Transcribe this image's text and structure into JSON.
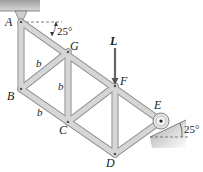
{
  "diagram": {
    "type": "truss",
    "joints": {
      "A": {
        "label": "A",
        "x": 21,
        "y": 22
      },
      "G": {
        "label": "G",
        "x": 68,
        "y": 52
      },
      "B": {
        "label": "B",
        "x": 21,
        "y": 89
      },
      "C": {
        "label": "C",
        "x": 68,
        "y": 122
      },
      "F": {
        "label": "F",
        "x": 115,
        "y": 86
      },
      "D": {
        "label": "D",
        "x": 115,
        "y": 154
      },
      "E": {
        "label": "E",
        "x": 161,
        "y": 121
      }
    },
    "members": [
      "AB",
      "AG",
      "GF",
      "FE",
      "BG",
      "BC",
      "GC",
      "CF",
      "CD",
      "FD",
      "DE"
    ],
    "dimension_labels": [
      {
        "text": "b",
        "member": "BG"
      },
      {
        "text": "b",
        "member": "GC"
      },
      {
        "text": "b",
        "member": "BC"
      }
    ],
    "load": {
      "label": "L",
      "joint": "F",
      "direction": "down"
    },
    "angles": [
      {
        "text": "25°",
        "location": "at A between horizontal and member AG"
      },
      {
        "text": "25°",
        "location": "incline of roller support at E"
      }
    ],
    "supports": [
      {
        "joint": "A",
        "type": "pin",
        "ground": "ceiling"
      },
      {
        "joint": "E",
        "type": "roller",
        "ground": "inclined surface"
      }
    ],
    "colors": {
      "member_fill": "#d6d6d6",
      "member_edge": "#8a8a8a",
      "ground": "#b8b8b8",
      "text": "#1a1a1a"
    }
  }
}
